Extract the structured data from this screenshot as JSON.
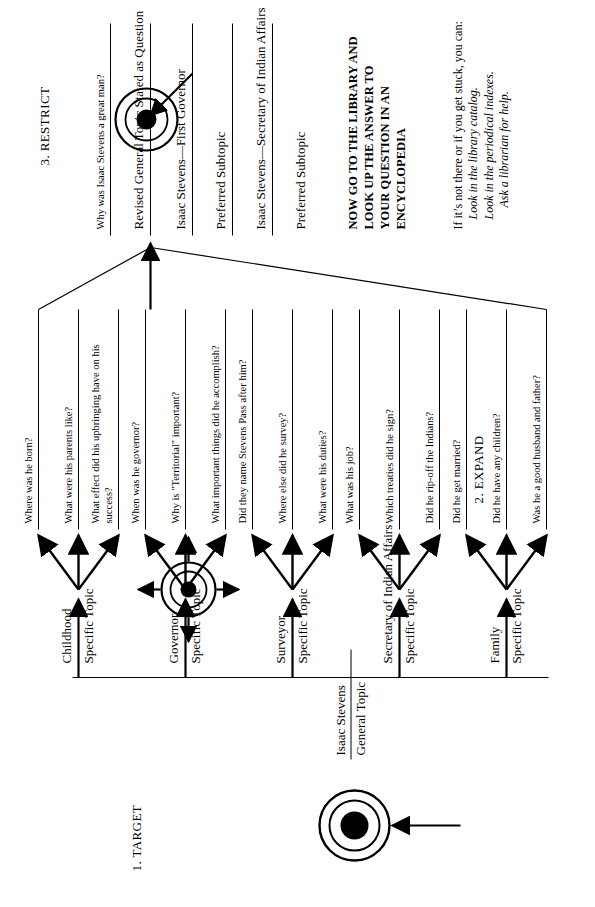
{
  "diagram": {
    "title_stages": [
      {
        "id": "target",
        "label": "1. TARGET"
      },
      {
        "id": "expand",
        "label": "2. EXPAND"
      },
      {
        "id": "restrict",
        "label": "3. RESTRICT"
      }
    ],
    "target_column": {
      "name_line": "Isaac Stevens",
      "role_line": "General Topic"
    },
    "expand_column": {
      "branches": [
        {
          "topic": "Childhood",
          "subtitle": "Specific Topic",
          "questions": [
            "Where was he born?",
            "What were his parents like?",
            "What effect did his upbringing have on his success?"
          ]
        },
        {
          "topic": "Governor",
          "subtitle": "Specific Topic",
          "questions": [
            "When was he governor?",
            "Why is \"Territorial\" important?",
            "What important things did he accomplish?"
          ]
        },
        {
          "topic": "Surveyor",
          "subtitle": "Specific Topic",
          "questions": [
            "Did they name Stevens Pass after him?",
            "Where else did he survey?",
            "What were his duties?"
          ]
        },
        {
          "topic": "Secretary of Indian Affairs",
          "subtitle": "Specific Topic",
          "questions": [
            "What was his job?",
            "Which treaties did he sign?",
            "Did he rip-off the Indians?"
          ]
        },
        {
          "topic": "Family",
          "subtitle": "Specific Topic",
          "questions": [
            "Did he get married?",
            "Did he have any children?",
            "Was he a good husband and father?"
          ]
        }
      ]
    },
    "restrict_column": {
      "chosen_question": "Why was Isaac Stevens a great man?",
      "chosen_question_caption": "Revised General Topic Stated as Question",
      "preferred_topic": "Isaac Stevens—First Governor",
      "preferred_topic_caption": "Preferred Subtopic",
      "preferred_subtopic": "Isaac Stevens—Secretary of Indian Affairs",
      "preferred_subtopic_caption": "Preferred Subtopic",
      "instruction_lines": [
        "NOW GO TO THE LIBRARY AND",
        "LOOK UP THE ANSWER TO",
        "YOUR QUESTION IN AN",
        "ENCYCLOPEDIA"
      ],
      "fallback_intro": "If it’s not there or if you get stuck, you can:",
      "fallback_items": [
        "Look in the library catalog.",
        "Look in the periodical indexes.",
        "Ask a librarian for help."
      ]
    },
    "icons": {
      "target_bullseye": "bullseye-icon",
      "expand_bullseye": "bullseye-expand-icon",
      "restrict_bullseye": "bullseye-restrict-icon",
      "incoming_arrow": "arrow-up-icon"
    },
    "colors": {
      "ink": "#000000",
      "paper": "#ffffff"
    }
  }
}
